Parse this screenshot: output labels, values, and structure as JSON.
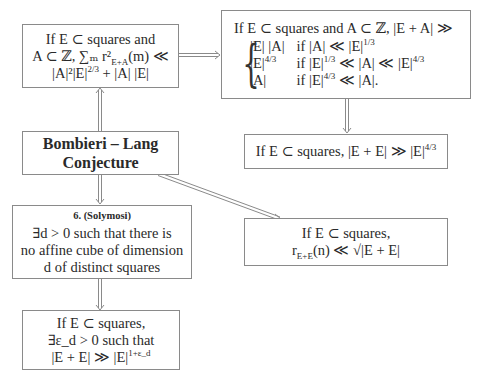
{
  "diagram": {
    "boxes": {
      "sum_bound": {
        "line1": "If E ⊂ squares and",
        "line2": "A ⊂ ℤ, ∑ₘ r²_{E+A}(m) ≪",
        "line3": "|A|²|E|^{2/3} + |A| |E|"
      },
      "sumset_cases": {
        "header": "If E ⊂ squares and A ⊂ ℤ, |E + A| ≫",
        "cases": [
          {
            "value": "|E| |A|",
            "condition": "if |A| ≪ |E|^{1/3}"
          },
          {
            "value": "|E|^{4/3}",
            "condition": "if |E|^{1/3} ≪ |A| ≪ |E|^{4/3}"
          },
          {
            "value": "|A|",
            "condition": "if |E|^{4/3} ≪ |A|."
          }
        ]
      },
      "sumset_43": {
        "text": "If E ⊂ squares, |E + E| ≫ |E|^{4/3}"
      },
      "bombieri_lang": {
        "line1": "Bombieri – Lang",
        "line2": "Conjecture"
      },
      "solymosi": {
        "heading": "6. (Solymosi)",
        "line1": "∃d > 0 such that there is",
        "line2": "no affine cube of dimension",
        "line3": "d of distinct squares"
      },
      "representation": {
        "line1": "If E ⊂ squares,",
        "line2": "r_{E+E}(n) ≪ √|E + E|"
      },
      "epsilon_growth": {
        "line1": "If E ⊂ squares,",
        "line2": "∃ε_d > 0 such that",
        "line3": "|E + E| ≫ |E|^{1+ε_d}"
      }
    },
    "edges": [
      {
        "from": "bombieri_lang",
        "to": "sum_bound",
        "style": "double-arrow"
      },
      {
        "from": "sum_bound",
        "to": "sumset_cases",
        "style": "double-arrow"
      },
      {
        "from": "sumset_cases",
        "to": "sumset_43",
        "style": "double-arrow"
      },
      {
        "from": "bombieri_lang",
        "to": "solymosi",
        "style": "double-arrow"
      },
      {
        "from": "bombieri_lang",
        "to": "representation",
        "style": "double-arrow"
      },
      {
        "from": "solymosi",
        "to": "epsilon_growth",
        "style": "double-arrow"
      }
    ],
    "colors": {
      "border": "#8a8a8a",
      "arrow": "#8a8a8a",
      "text": "#2a2a2a"
    }
  }
}
